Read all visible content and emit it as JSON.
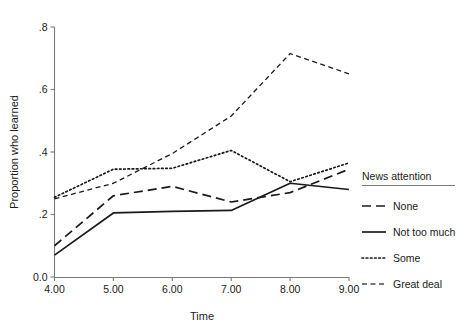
{
  "chart_data": {
    "type": "line",
    "title": "",
    "xlabel": "Time",
    "ylabel": "Proportion who learned",
    "x": [
      4.0,
      5.0,
      6.0,
      7.0,
      8.0,
      9.0
    ],
    "xtick_labels": [
      "4.00",
      "5.00",
      "6.00",
      "7.00",
      "8.00",
      "9.00"
    ],
    "ytick_labels": [
      "0.0",
      ".2",
      ".4",
      ".6",
      ".8"
    ],
    "ytick_values": [
      0.0,
      0.2,
      0.4,
      0.6,
      0.8
    ],
    "xlim": [
      4.0,
      9.0
    ],
    "ylim": [
      0.0,
      0.8
    ],
    "grid": false,
    "legend_position": "right",
    "legend_title": "News attention",
    "series": [
      {
        "name": "None",
        "dash": "long-dash",
        "stroke_width": 1.7,
        "color": "#1a1a1a",
        "values": [
          0.1,
          0.26,
          0.29,
          0.24,
          0.27,
          0.345
        ]
      },
      {
        "name": "Not too much",
        "dash": "solid",
        "stroke_width": 1.7,
        "color": "#1a1a1a",
        "values": [
          0.07,
          0.205,
          0.21,
          0.213,
          0.3,
          0.28
        ]
      },
      {
        "name": "Some",
        "dash": "dotted",
        "stroke_width": 1.7,
        "color": "#1a1a1a",
        "values": [
          0.255,
          0.345,
          0.348,
          0.405,
          0.305,
          0.365
        ]
      },
      {
        "name": "Great deal",
        "dash": "short-dash",
        "stroke_width": 1.3,
        "color": "#4a4a4a",
        "values": [
          0.25,
          0.3,
          0.395,
          0.515,
          0.715,
          0.65
        ]
      }
    ]
  },
  "legend": {
    "title": "News attention",
    "items": [
      {
        "label": "None"
      },
      {
        "label": "Not too much"
      },
      {
        "label": "Some"
      },
      {
        "label": "Great deal"
      }
    ]
  },
  "axes": {
    "x_title": "Time",
    "y_title": "Proportion who learned"
  }
}
